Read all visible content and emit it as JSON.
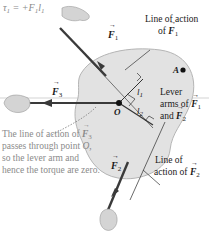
{
  "equation": {
    "tau": "τ",
    "tau_sub": "1",
    "rhs": " = +F",
    "rhs_sub": "1",
    "l": "l",
    "l_sub": "1"
  },
  "labels": {
    "line_of_action_f1_line1": "Line of action",
    "line_of_action_f1_line2": "of ",
    "point_a": "A",
    "point_o": "O",
    "f1": "F",
    "f1_sub": "1",
    "f2": "F",
    "f2_sub": "2",
    "f3": "F",
    "f3_sub": "3",
    "l1": "l",
    "l1_sub": "1",
    "l2": "l",
    "l2_sub": "2",
    "lever_arms_line1": "Lever",
    "lever_arms_line2": "arms of ",
    "lever_arms_line3": "and ",
    "line_of_action_f2_line1": "Line of",
    "line_of_action_f2_line2": "action of "
  },
  "note": {
    "line1": "The line of action of ",
    "line1_sub": "3",
    "line2": "passes through point ",
    "line2_o": "O,",
    "line3": "so the lever arm and",
    "line4": "hence the torque are zero."
  },
  "colors": {
    "body_fill": "#e2e2e2",
    "body_stroke": "#b0b0b0",
    "force_arrow": "#3a3a3a",
    "note_text": "#8a8a8a",
    "text": "#1a1a1a"
  }
}
